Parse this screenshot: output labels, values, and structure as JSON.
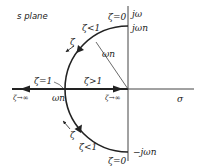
{
  "title": "s plane",
  "axes": {
    "imag_label": "jω",
    "real_label": "σ"
  },
  "points": {
    "top": "jωn",
    "bottom": "−jωn",
    "left": "ωn",
    "radius": "ωn"
  },
  "annotations": {
    "zeta_zero_top": "ζ=0",
    "zeta_zero_bottom": "ζ=0",
    "zeta_lt1_top": "ζ<1",
    "zeta_lt1_bottom": "ζ<1",
    "zeta_eq1": "ζ=1",
    "zeta_gt1": "ζ>1",
    "zeta_inf_left": "ζ→∞",
    "zeta_inf_right": "ζ→∞",
    "zeta_dir_top": "ζ",
    "zeta_dir_bottom": "ζ"
  }
}
